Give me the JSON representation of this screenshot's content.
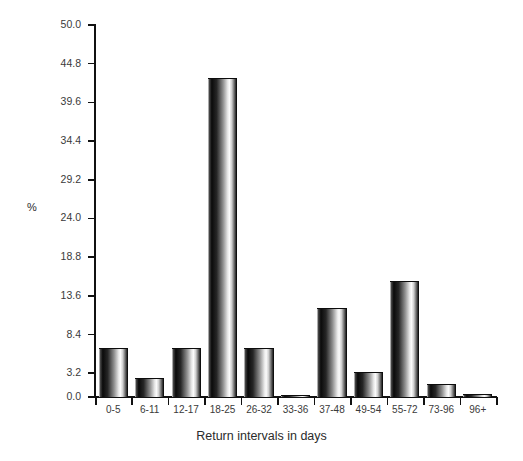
{
  "chart_data": {
    "type": "bar",
    "title": "",
    "subtitle": "",
    "xlabel": "Return intervals in days",
    "ylabel": "%",
    "categories": [
      "0-5",
      "6-11",
      "12-17",
      "18-25",
      "26-32",
      "33-36",
      "37-48",
      "49-54",
      "55-72",
      "73-96",
      "96+"
    ],
    "values": [
      6.5,
      2.4,
      6.5,
      42.7,
      6.5,
      0.2,
      11.8,
      3.2,
      15.5,
      1.6,
      0.3
    ],
    "series": [
      {
        "name": "Percentage of returns",
        "values": [
          6.5,
          2.4,
          6.5,
          42.7,
          6.5,
          0.2,
          11.8,
          3.2,
          15.5,
          1.6,
          0.3
        ]
      }
    ],
    "ylim": [
      0.0,
      50.0
    ],
    "ytick_labels": [
      "0.0",
      "3.2",
      "8.4",
      "13.6",
      "18.8",
      "24.0",
      "29.2",
      "34.4",
      "39.6",
      "44.8",
      "50.0"
    ],
    "ytick_values": [
      0.0,
      3.2,
      8.4,
      13.6,
      18.8,
      24.0,
      29.2,
      34.4,
      39.6,
      44.8,
      50.0
    ],
    "grid": false,
    "legend": false,
    "legend_position": "none",
    "bar_style": "3d-cylinder-grayscale",
    "colors": {
      "axis": "#111111",
      "text": "#3a3a3a",
      "background": "#ffffff",
      "bar_dark": "#000000",
      "bar_light": "#fbfbfb"
    }
  }
}
